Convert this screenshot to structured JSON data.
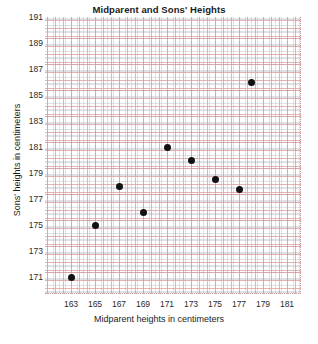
{
  "chart_data": {
    "type": "scatter",
    "title": "Midparent and Sons' Heights",
    "xlabel": "Midparent heights in centimeters",
    "ylabel": "Sons' heights in centimeters",
    "xlim": [
      162,
      182
    ],
    "ylim": [
      170,
      192
    ],
    "xticks": [
      163,
      165,
      167,
      169,
      171,
      173,
      175,
      177,
      179,
      181
    ],
    "yticks": [
      171,
      173,
      175,
      177,
      179,
      181,
      183,
      185,
      187,
      189,
      191
    ],
    "grid": true,
    "legend": null,
    "marker_color": "#111111",
    "grid_major_color": "#d68888",
    "grid_minor_color": "#9696a5",
    "points": [
      {
        "x": 163,
        "y": 171
      },
      {
        "x": 165,
        "y": 175
      },
      {
        "x": 167,
        "y": 178
      },
      {
        "x": 169,
        "y": 176
      },
      {
        "x": 171,
        "y": 181
      },
      {
        "x": 173,
        "y": 180
      },
      {
        "x": 175,
        "y": 178.5
      },
      {
        "x": 177,
        "y": 177.7
      },
      {
        "x": 178,
        "y": 186
      }
    ]
  }
}
